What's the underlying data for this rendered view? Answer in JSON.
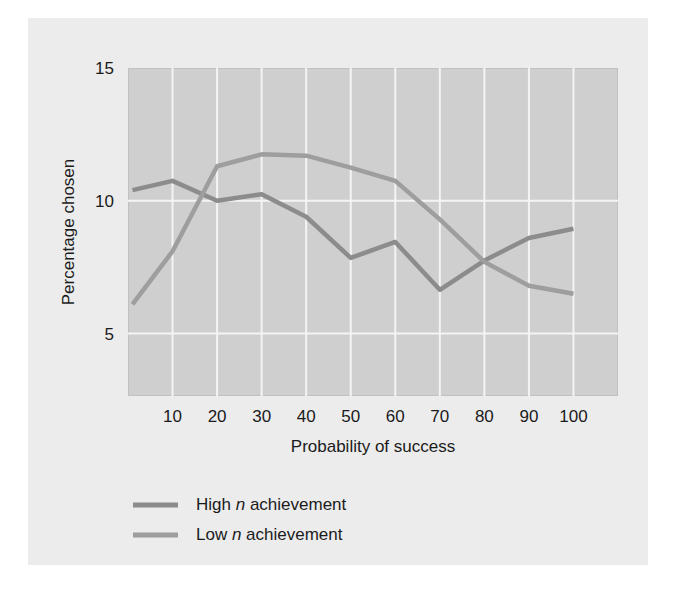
{
  "figure": {
    "background_color": "#ececed",
    "plot_background_color": "#cfcfcf",
    "gridline_color": "#f4f4f4"
  },
  "chart_data": {
    "type": "line",
    "title": "",
    "xlabel": "Probability of success",
    "ylabel": "Percentage chosen",
    "xlim": [
      0,
      110
    ],
    "ylim": [
      2.65,
      15.0
    ],
    "xticks": [
      10,
      20,
      30,
      40,
      50,
      60,
      70,
      80,
      90,
      100
    ],
    "xtick_labels": [
      "10",
      "20",
      "30",
      "40",
      "50",
      "60",
      "70",
      "80",
      "90",
      "100"
    ],
    "yticks": [
      5,
      10,
      15
    ],
    "ytick_labels": [
      "5",
      "10",
      "15"
    ],
    "grid": "both",
    "legend_position": "below-left",
    "x": [
      1,
      10,
      20,
      30,
      40,
      50,
      60,
      70,
      80,
      90,
      100
    ],
    "series": [
      {
        "name": "High n achievement",
        "label_prefix": "High",
        "label_italic": "n",
        "label_suffix": "achievement",
        "color": "#8c8c8c",
        "linewidth": 4.5,
        "values": [
          10.4,
          10.75,
          10.0,
          10.25,
          9.4,
          7.85,
          8.45,
          6.65,
          7.75,
          8.6,
          8.95
        ]
      },
      {
        "name": "Low n achievement",
        "label_prefix": "Low",
        "label_italic": "n",
        "label_suffix": "achievement",
        "color": "#9e9e9e",
        "linewidth": 4.5,
        "values": [
          6.1,
          8.1,
          11.3,
          11.75,
          11.7,
          11.25,
          10.75,
          9.3,
          7.7,
          6.8,
          6.5
        ]
      }
    ]
  },
  "legend": {
    "items": [
      {
        "prefix": "High",
        "italic": "n",
        "suffix": "achievement",
        "swatch_color": "#8c8c8c"
      },
      {
        "prefix": "Low",
        "italic": "n",
        "suffix": "achievement",
        "swatch_color": "#9e9e9e"
      }
    ]
  }
}
